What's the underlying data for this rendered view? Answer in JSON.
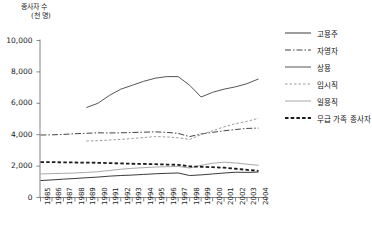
{
  "chart_data": {
    "type": "line",
    "title": "",
    "ylabel_line1": "종사자 수",
    "ylabel_line2": "(천 명)",
    "xlabel": "",
    "ylim": [
      0,
      10000
    ],
    "yticks": [
      0,
      2000,
      4000,
      6000,
      8000,
      10000
    ],
    "ytick_labels": [
      "0",
      "2,000",
      "4,000",
      "6,000",
      "8,000",
      "10,000"
    ],
    "grid": false,
    "legend_position": "right",
    "x": [
      1985,
      1986,
      1987,
      1988,
      1989,
      1990,
      1991,
      1992,
      1993,
      1994,
      1995,
      1996,
      1997,
      1998,
      1999,
      2000,
      2001,
      2002,
      2003,
      2004
    ],
    "categories": [
      "1985",
      "1986",
      "1987",
      "1988",
      "1989",
      "1990",
      "1991",
      "1992",
      "1993",
      "1994",
      "1995",
      "1996",
      "1997",
      "1998",
      "1999",
      "2000",
      "2001",
      "2002",
      "2003",
      "2004"
    ],
    "series": [
      {
        "name": "고용주",
        "style": "solid",
        "color": "#3a3a3a",
        "width": 1.0,
        "values": [
          1080,
          1120,
          1170,
          1210,
          1260,
          1300,
          1360,
          1400,
          1430,
          1470,
          1510,
          1540,
          1560,
          1400,
          1440,
          1500,
          1560,
          1610,
          1600,
          1620
        ]
      },
      {
        "name": "자영자",
        "style": "dashdot",
        "color": "#444444",
        "width": 1.0,
        "values": [
          3980,
          3990,
          4020,
          4060,
          4090,
          4120,
          4110,
          4120,
          4140,
          4160,
          4180,
          4150,
          4080,
          3880,
          4050,
          4150,
          4250,
          4330,
          4400,
          4420
        ]
      },
      {
        "name": "상용",
        "style": "solid",
        "color": "#555555",
        "width": 1.0,
        "values": [
          null,
          null,
          null,
          null,
          5730,
          6000,
          6500,
          6900,
          7150,
          7400,
          7600,
          7700,
          7700,
          7150,
          6400,
          6700,
          6900,
          7050,
          7250,
          7550
        ]
      },
      {
        "name": "임시직",
        "style": "dotted",
        "color": "#9a9a9a",
        "width": 1.0,
        "values": [
          null,
          null,
          null,
          null,
          3600,
          3620,
          3660,
          3700,
          3760,
          3820,
          3880,
          3860,
          3800,
          3700,
          4000,
          4250,
          4500,
          4700,
          4850,
          5050
        ]
      },
      {
        "name": "일용직",
        "style": "solid",
        "color": "#a8a8a8",
        "width": 1.0,
        "values": [
          1500,
          1520,
          1540,
          1560,
          1600,
          1640,
          1720,
          1800,
          1860,
          1900,
          1940,
          1960,
          1980,
          1880,
          2050,
          2180,
          2250,
          2200,
          2120,
          2050
        ]
      },
      {
        "name": "무급 가족 종사자",
        "style": "dashed-bold",
        "color": "#1a1a1a",
        "width": 1.8,
        "values": [
          2250,
          2250,
          2240,
          2230,
          2220,
          2210,
          2190,
          2170,
          2150,
          2140,
          2120,
          2100,
          2080,
          1980,
          1960,
          1930,
          1900,
          1830,
          1760,
          1700
        ]
      }
    ]
  },
  "legend": {
    "items": [
      {
        "label": "고용주"
      },
      {
        "label": "자영자"
      },
      {
        "label": "상용"
      },
      {
        "label": "임시직"
      },
      {
        "label": "일용직"
      },
      {
        "label": "무급 가족 종사자"
      }
    ]
  }
}
